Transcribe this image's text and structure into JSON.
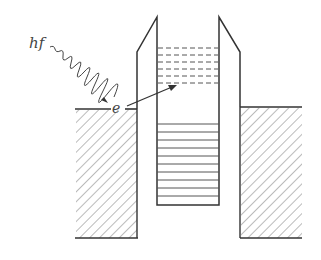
{
  "diagram": {
    "labels": {
      "photon": "hf",
      "electron": "e"
    },
    "colors": {
      "line": "#333333",
      "hatch": "#666666",
      "background": "#ffffff"
    },
    "well": {
      "filled_levels": 10,
      "empty_levels_dashed": 6
    }
  }
}
